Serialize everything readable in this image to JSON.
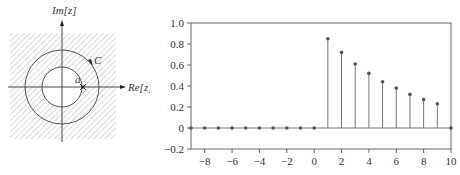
{
  "zplane": {
    "im_label": "Im[z]",
    "re_label": "Re[z]",
    "contour_label": "C",
    "pole_label": "a"
  },
  "chart_data": {
    "type": "stem",
    "title": "",
    "xlabel": "",
    "ylabel": "",
    "xlim": [
      -9,
      10
    ],
    "ylim": [
      -0.2,
      1.0
    ],
    "grid": false,
    "x_ticks": [
      -8,
      -6,
      -4,
      -2,
      0,
      2,
      4,
      6,
      8,
      10
    ],
    "x_tick_labels": [
      "−8",
      "−6",
      "−4",
      "−2",
      "0",
      "2",
      "4",
      "6",
      "8",
      "10"
    ],
    "y_ticks": [
      -0.2,
      0,
      0.2,
      0.4,
      0.6,
      0.8,
      1.0
    ],
    "y_tick_labels": [
      "−0.2",
      "0",
      "0.2",
      "0.4",
      "0.6",
      "0.8",
      "1.0"
    ],
    "x": [
      -9,
      -8,
      -7,
      -6,
      -5,
      -4,
      -3,
      -2,
      -1,
      0,
      1,
      2,
      3,
      4,
      5,
      6,
      7,
      8,
      9,
      10
    ],
    "values": [
      0,
      0,
      0,
      0,
      0,
      0,
      0,
      0,
      0,
      0,
      0.85,
      0.72,
      0.61,
      0.52,
      0.44,
      0.38,
      0.32,
      0.27,
      0.23,
      0
    ]
  }
}
